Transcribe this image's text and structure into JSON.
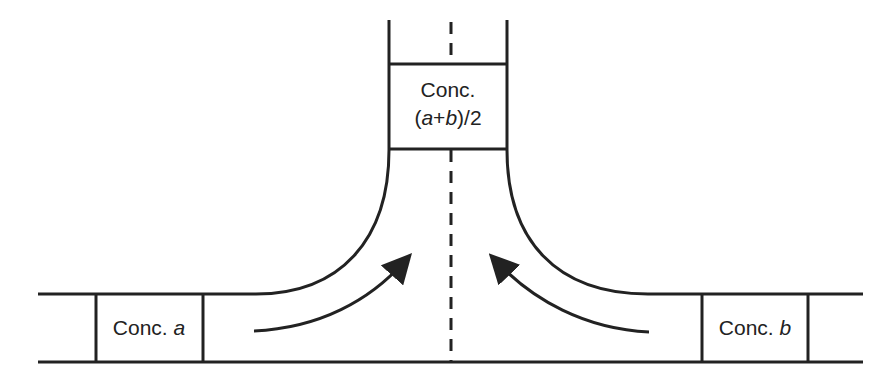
{
  "diagram": {
    "type": "T-junction mixing flow",
    "colors": {
      "line": "#222222",
      "background": "#ffffff"
    },
    "top_box": {
      "line1": "Conc.",
      "line2_open": "(",
      "line2_a": "a",
      "line2_plus": "+",
      "line2_b": "b",
      "line2_close": ")/2"
    },
    "left_box": {
      "prefix": "Conc. ",
      "var": "a"
    },
    "right_box": {
      "prefix": "Conc. ",
      "var": "b"
    },
    "arrows": [
      {
        "name": "left-flow-arrow",
        "direction": "up-right"
      },
      {
        "name": "right-flow-arrow",
        "direction": "up-left"
      }
    ],
    "center_line": "dashed"
  }
}
